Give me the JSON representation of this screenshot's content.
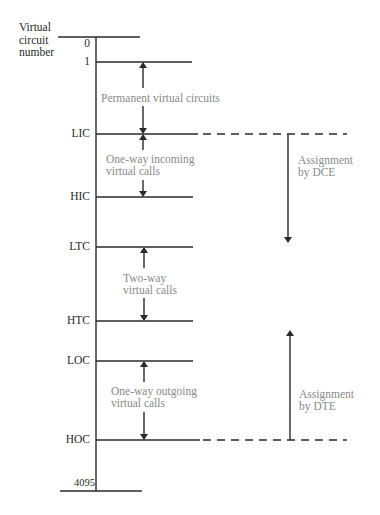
{
  "axis_title": [
    "Virtual",
    "circuit",
    "number"
  ],
  "levels": [
    {
      "label": "0",
      "y": 37
    },
    {
      "label": "1",
      "y": 62
    },
    {
      "label": "LIC",
      "y": 134
    },
    {
      "label": "HIC",
      "y": 197
    },
    {
      "label": "LTC",
      "y": 247
    },
    {
      "label": "HTC",
      "y": 321
    },
    {
      "label": "LOC",
      "y": 361
    },
    {
      "label": "HOC",
      "y": 440
    },
    {
      "label": "4095",
      "y": 490
    }
  ],
  "ranges": [
    {
      "text": "Permanent virtual circuits"
    },
    {
      "line1": "One-way incoming",
      "line2": "virtual calls"
    },
    {
      "line1": "Two-way",
      "line2": "virtual calls"
    },
    {
      "line1": "One-way outgoing",
      "line2": "virtual calls"
    }
  ],
  "assignments": [
    {
      "line1": "Assignment",
      "line2": "by DCE"
    },
    {
      "line1": "Assignment",
      "line2": "by DTE"
    }
  ],
  "colors": {
    "line": "#2a2a2a",
    "range_text": "#8a8a8a"
  }
}
